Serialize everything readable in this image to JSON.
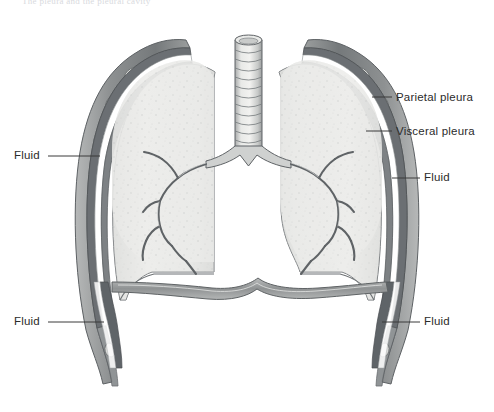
{
  "figure": {
    "cut_off_caption": "The pleura and the pleural cavity",
    "view": "anterior coronal section",
    "style": "grayscale medical illustration",
    "background_color": "#ffffff",
    "ink_color": "#2b2b2b",
    "lung_fill_color": "#e9e9e7",
    "pleura_color": "#6e7277",
    "fluid_color": "#ffffff",
    "rib_color": "#cfd1d0"
  },
  "labels": [
    {
      "id": "parietal-pleura",
      "text": "Parietal pleura",
      "side": "right",
      "x": 396,
      "y": 92,
      "leader_from_x": 372,
      "leader_from_y": 97,
      "leader_to_x": 392,
      "leader_to_y": 97
    },
    {
      "id": "visceral-pleura",
      "text": "Visceral pleura",
      "side": "right",
      "x": 396,
      "y": 126,
      "leader_from_x": 366,
      "leader_from_y": 131,
      "leader_to_x": 392,
      "leader_to_y": 131
    },
    {
      "id": "fluid-upper-left",
      "text": "Fluid",
      "side": "left",
      "x": 14,
      "y": 150,
      "leader_from_x": 48,
      "leader_from_y": 156,
      "leader_to_x": 100,
      "leader_to_y": 156
    },
    {
      "id": "fluid-upper-right",
      "text": "Fluid",
      "side": "right",
      "x": 424,
      "y": 172,
      "leader_from_x": 392,
      "leader_from_y": 178,
      "leader_to_x": 420,
      "leader_to_y": 178
    },
    {
      "id": "fluid-lower-left",
      "text": "Fluid",
      "side": "left",
      "x": 14,
      "y": 316,
      "leader_from_x": 48,
      "leader_from_y": 322,
      "leader_to_x": 104,
      "leader_to_y": 322
    },
    {
      "id": "fluid-lower-right",
      "text": "Fluid",
      "side": "right",
      "x": 424,
      "y": 316,
      "leader_from_x": 382,
      "leader_from_y": 322,
      "leader_to_x": 420,
      "leader_to_y": 322
    }
  ],
  "structures": [
    {
      "id": "trachea",
      "name": "Trachea",
      "note": "midline airway with cartilage rings"
    },
    {
      "id": "carina",
      "name": "Carina",
      "note": "tracheal bifurcation"
    },
    {
      "id": "left-main-bronchus",
      "name": "Left main bronchus",
      "note": "branching bronchial tree"
    },
    {
      "id": "right-main-bronchus",
      "name": "Right main bronchus",
      "note": "branching bronchial tree"
    },
    {
      "id": "left-lung",
      "name": "Left lung",
      "note": "cut surface, stippled parenchyma"
    },
    {
      "id": "right-lung",
      "name": "Right lung",
      "note": "cut surface, stippled parenchyma"
    },
    {
      "id": "diaphragm",
      "name": "Diaphragm",
      "note": "domed muscular sheet at lung bases"
    },
    {
      "id": "ribs",
      "name": "Ribs",
      "note": "oval cross-sections in chest wall"
    },
    {
      "id": "chest-wall",
      "name": "Chest wall",
      "note": "thoracic wall flanking both lungs"
    },
    {
      "id": "costodiaphragmatic-recess",
      "name": "Costodiaphragmatic recess",
      "note": "pleural fluid wedge at lung base"
    }
  ]
}
